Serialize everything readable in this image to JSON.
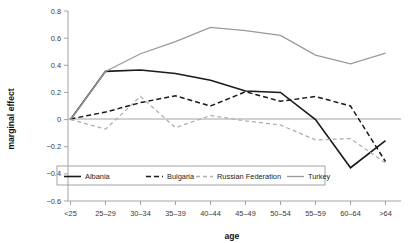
{
  "chart_data": {
    "type": "line",
    "title": "",
    "xlabel": "age",
    "ylabel": "marginal effect",
    "categories": [
      "<25",
      "25–29",
      "30–34",
      "35–39",
      "40–44",
      "45–49",
      "50–54",
      "55–59",
      "60–64",
      ">64"
    ],
    "ylim": [
      -0.6,
      0.8
    ],
    "yticks": [
      -0.6,
      -0.4,
      -0.2,
      0,
      0.2,
      0.4,
      0.6,
      0.8
    ],
    "ytick_labels": [
      "−0.6",
      "−0.4",
      "−0.2",
      "0",
      "0.2",
      "0.4",
      "0.6",
      "0.8"
    ],
    "grid": false,
    "legend_position": "inside-bottom-left",
    "series": [
      {
        "name": "Albania",
        "color": "#1a1a1a",
        "style": "solid",
        "width": 1.6,
        "values": [
          0.0,
          0.355,
          0.365,
          0.34,
          0.29,
          0.21,
          0.2,
          0.0,
          -0.355,
          -0.155
        ]
      },
      {
        "name": "Bulgaria",
        "color": "#1a1a1a",
        "style": "dashed",
        "width": 1.5,
        "values": [
          0.005,
          0.055,
          0.125,
          0.175,
          0.1,
          0.205,
          0.135,
          0.17,
          0.1,
          -0.31
        ]
      },
      {
        "name": "Russian Federation",
        "color": "#b0b0b0",
        "style": "dashed",
        "width": 1.3,
        "values": [
          0.0,
          -0.07,
          0.17,
          -0.06,
          0.03,
          -0.01,
          -0.04,
          -0.15,
          -0.14,
          -0.32
        ]
      },
      {
        "name": "Turkey",
        "color": "#9a9a9a",
        "style": "solid",
        "width": 1.3,
        "values": [
          0.0,
          0.355,
          0.485,
          0.575,
          0.68,
          0.655,
          0.62,
          0.475,
          0.41,
          0.49
        ]
      }
    ]
  }
}
